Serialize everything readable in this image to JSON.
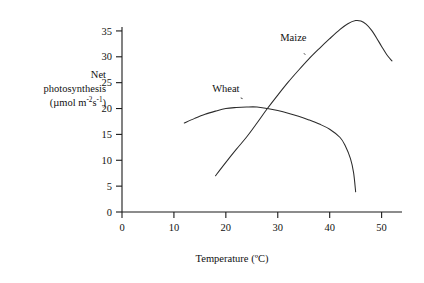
{
  "chart_data": {
    "type": "line",
    "title": "",
    "xlabel": "Temperature (ºC)",
    "ylabel_lines": [
      "Net",
      "photosynthesis",
      "(µmol m-2s-1)"
    ],
    "ylabel_units_prefix": "(µmol m",
    "ylabel_units_sup1": "-2",
    "ylabel_units_mid": "s",
    "ylabel_units_sup2": "-1",
    "ylabel_units_suffix": ")",
    "xlim": [
      0,
      52
    ],
    "ylim": [
      0,
      37.5
    ],
    "xticks": [
      0,
      10,
      20,
      30,
      40,
      50
    ],
    "yticks": [
      0,
      5,
      10,
      15,
      20,
      25,
      30,
      35
    ],
    "grid": false,
    "legend_position": "inline-annotations",
    "series": [
      {
        "name": "Wheat",
        "label_x": 20.0,
        "label_y": 23.2,
        "points": [
          [
            12.0,
            17.2
          ],
          [
            14.0,
            18.1
          ],
          [
            16.0,
            18.9
          ],
          [
            18.0,
            19.5
          ],
          [
            20.0,
            20.0
          ],
          [
            22.0,
            20.2
          ],
          [
            24.0,
            20.3
          ],
          [
            26.0,
            20.3
          ],
          [
            28.0,
            20.0
          ],
          [
            30.0,
            19.6
          ],
          [
            32.0,
            19.1
          ],
          [
            34.0,
            18.5
          ],
          [
            36.0,
            17.8
          ],
          [
            38.0,
            17.0
          ],
          [
            40.0,
            16.0
          ],
          [
            42.0,
            14.4
          ],
          [
            43.0,
            12.8
          ],
          [
            44.0,
            10.3
          ],
          [
            44.6,
            7.6
          ],
          [
            45.0,
            3.9
          ]
        ]
      },
      {
        "name": "Maize",
        "label_x": 33.0,
        "label_y": 33.0,
        "points": [
          [
            18.0,
            7.0
          ],
          [
            20.0,
            9.6
          ],
          [
            22.0,
            12.1
          ],
          [
            24.0,
            14.5
          ],
          [
            26.0,
            17.2
          ],
          [
            28.0,
            20.0
          ],
          [
            30.0,
            22.6
          ],
          [
            32.0,
            25.1
          ],
          [
            34.0,
            27.4
          ],
          [
            36.0,
            29.6
          ],
          [
            38.0,
            31.6
          ],
          [
            40.0,
            33.5
          ],
          [
            42.0,
            35.3
          ],
          [
            43.5,
            36.4
          ],
          [
            45.0,
            37.0
          ],
          [
            46.0,
            36.9
          ],
          [
            47.0,
            36.3
          ],
          [
            48.0,
            35.2
          ],
          [
            49.0,
            33.7
          ],
          [
            50.0,
            32.0
          ],
          [
            51.0,
            30.4
          ],
          [
            52.0,
            29.2
          ]
        ]
      }
    ],
    "annotations": [
      {
        "text": "Wheat",
        "leader": true
      },
      {
        "text": "Maize",
        "leader": true
      }
    ]
  },
  "colors": {
    "axis": "#1a1a1a",
    "curve": "#2b2b2b",
    "background": "#ffffff",
    "text": "#111111"
  }
}
